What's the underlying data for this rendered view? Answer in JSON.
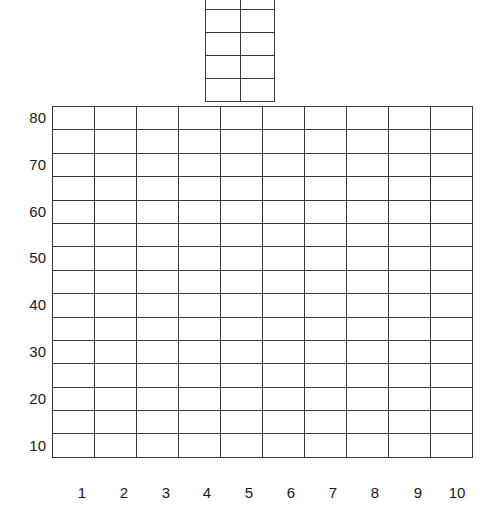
{
  "chart_data": {
    "type": "table",
    "title": "",
    "xlabel": "",
    "ylabel": "",
    "x_ticks": [
      "1",
      "2",
      "3",
      "4",
      "5",
      "6",
      "7",
      "8",
      "9",
      "10"
    ],
    "y_ticks": [
      "80",
      "70",
      "60",
      "50",
      "40",
      "30",
      "20",
      "10"
    ],
    "grid": true,
    "main_grid": {
      "rows": 15,
      "cols": 10
    },
    "top_grid": {
      "rows": 5,
      "cols": 2
    },
    "values": []
  },
  "y_labels": [
    "80",
    "70",
    "60",
    "50",
    "40",
    "30",
    "20",
    "10"
  ],
  "x_labels": [
    "1",
    "2",
    "3",
    "4",
    "5",
    "6",
    "7",
    "8",
    "9",
    "10"
  ]
}
